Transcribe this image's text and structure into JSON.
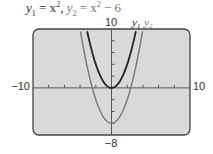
{
  "title": {
    "y1_label": "y",
    "y1_sub": "1",
    "y1_expr": " = x",
    "y1_exp": "2",
    "sep": ",  ",
    "y2_label": "y",
    "y2_sub": "2",
    "y2_expr": " = x",
    "y2_exp": "2",
    "y2_tail": " − 6"
  },
  "axis_labels": {
    "xmin": "−10",
    "xmax": "10",
    "ymax": "10",
    "ymin": "−8"
  },
  "legend": {
    "y1": "y",
    "y1_sub": "1",
    "y2": "y",
    "y2_sub": "2"
  },
  "colors": {
    "frame_fill": "#d9d9d9",
    "frame_stroke": "#444444",
    "y1_curve": "#222222",
    "y2_curve": "#777777",
    "axes": "#555555"
  },
  "chart_data": {
    "type": "line",
    "xlabel": "",
    "ylabel": "",
    "xlim": [
      -10,
      10
    ],
    "ylim": [
      -8,
      10
    ],
    "xscale_ticks": 2,
    "yscale_ticks": 2,
    "grid": false,
    "legend_position": "top",
    "series": [
      {
        "name": "y1",
        "expression": "x^2",
        "vertex": [
          0,
          0
        ]
      },
      {
        "name": "y2",
        "expression": "x^2 - 6",
        "vertex": [
          0,
          -6
        ]
      }
    ]
  }
}
